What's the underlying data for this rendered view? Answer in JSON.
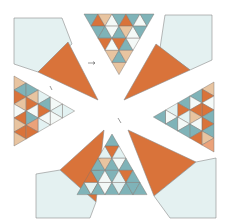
{
  "figure": {
    "width": 228,
    "height": 224
  },
  "palette": {
    "orange": "#d9733a",
    "teal": "#7fb3b8",
    "pale_blue": "#e3f2f2",
    "tan": "#e8c4a0",
    "white_blue": "#f2f8f6",
    "outline": "#8a8a8a",
    "background": "#ffffff"
  },
  "units": [
    {
      "name": "top-unit",
      "background_piece": {
        "color": "pale_blue",
        "points": "82,10 206,10 206,70 190,78 150,78 114,118 90,78"
      },
      "large_triangles": [
        {
          "color": "orange",
          "points": "60,58 98,58 114,118 75,96"
        },
        {
          "color": "orange",
          "points": "155,55 190,78 150,78 114,118"
        }
      ],
      "triangle_grid": {
        "origin": [
          85,
          13
        ],
        "size": 15,
        "rows": 6,
        "direction": "down",
        "colors": [
          [
            "teal",
            "orange",
            "tan",
            "white_blue",
            "teal",
            "orange",
            "teal"
          ],
          [
            "teal",
            "white_blue",
            "teal",
            "tan",
            "teal"
          ],
          [
            "orange",
            "teal",
            "white_blue"
          ],
          [
            "tan"
          ]
        ]
      }
    }
  ],
  "annotations": [
    {
      "name": "arrow-mark-1",
      "x": 92,
      "y": 62
    },
    {
      "name": "arrow-mark-2",
      "x": 50,
      "y": 86
    },
    {
      "name": "arrow-mark-3",
      "x": 118,
      "y": 122
    },
    {
      "name": "arrow-mark-4",
      "x": 122,
      "y": 186
    }
  ]
}
